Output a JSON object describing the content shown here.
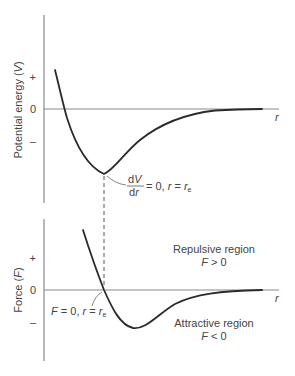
{
  "top_plot": {
    "y_axis_label": "Potential energy (V)",
    "y_axis_label_text": "Potential energy (",
    "y_axis_label_var": "V",
    "y_axis_label_close": ")",
    "tick_plus": "+",
    "tick_zero": "0",
    "tick_minus": "–",
    "x_axis_label": "r",
    "annotation_numerator": "dV",
    "annotation_num_d": "d",
    "annotation_num_v": "V",
    "annotation_denominator": "dr",
    "annotation_den_d": "d",
    "annotation_den_r": "r",
    "annotation_rest": "= 0, ",
    "annotation_r": "r",
    "annotation_eq": " = ",
    "annotation_re": "r",
    "annotation_sub": "e"
  },
  "bottom_plot": {
    "y_axis_label": "Force (F)",
    "y_axis_label_text": "Force (",
    "y_axis_label_var": "F",
    "y_axis_label_close": ")",
    "tick_plus": "+",
    "tick_zero": "0",
    "tick_minus": "–",
    "x_axis_label": "r",
    "annotation_F": "F",
    "annotation_rest": " = 0, ",
    "annotation_r": "r",
    "annotation_eq": " = ",
    "annotation_re": "r",
    "annotation_sub": "e",
    "repulsive_title": "Repulsive region",
    "repulsive_cond_var": "F",
    "repulsive_cond": " > 0",
    "attractive_title": "Attractive region",
    "attractive_cond_var": "F",
    "attractive_cond": " < 0"
  }
}
